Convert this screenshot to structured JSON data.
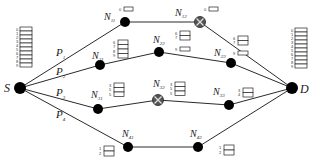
{
  "diagram": {
    "type": "network-path-diagram",
    "nodes": [
      {
        "id": "S",
        "label": "S",
        "sub": "",
        "x": 20,
        "y": 88,
        "failed": false
      },
      {
        "id": "D",
        "label": "D",
        "sub": "",
        "x": 292,
        "y": 88,
        "failed": false
      },
      {
        "id": "N11",
        "label": "N",
        "sub": "11",
        "x": 125,
        "y": 22,
        "failed": false
      },
      {
        "id": "N12",
        "label": "N",
        "sub": "12",
        "x": 200,
        "y": 22,
        "failed": true
      },
      {
        "id": "N21",
        "label": "N",
        "sub": "21",
        "x": 100,
        "y": 65,
        "failed": false
      },
      {
        "id": "N22",
        "label": "N",
        "sub": "22",
        "x": 159,
        "y": 52,
        "failed": false
      },
      {
        "id": "N23",
        "label": "N",
        "sub": "23",
        "x": 231,
        "y": 63,
        "failed": false
      },
      {
        "id": "N31",
        "label": "N",
        "sub": "31",
        "x": 98,
        "y": 109,
        "failed": false
      },
      {
        "id": "N32",
        "label": "N",
        "sub": "32",
        "x": 158,
        "y": 100,
        "failed": true
      },
      {
        "id": "N33",
        "label": "N",
        "sub": "33",
        "x": 229,
        "y": 105,
        "failed": false
      },
      {
        "id": "N41",
        "label": "N",
        "sub": "41",
        "x": 128,
        "y": 147,
        "failed": false
      },
      {
        "id": "N42",
        "label": "N",
        "sub": "42",
        "x": 198,
        "y": 147,
        "failed": false
      }
    ],
    "paths": [
      {
        "label": "P",
        "sub": "1",
        "route": [
          "S",
          "N11",
          "N12",
          "D"
        ]
      },
      {
        "label": "P",
        "sub": "2",
        "route": [
          "S",
          "N21",
          "N22",
          "N23",
          "D"
        ]
      },
      {
        "label": "P",
        "sub": "3",
        "route": [
          "S",
          "N31",
          "N32",
          "N33",
          "D"
        ]
      },
      {
        "label": "P",
        "sub": "4",
        "route": [
          "S",
          "N41",
          "N42",
          "D"
        ]
      }
    ],
    "buffers": [
      {
        "node": "S",
        "slots": [
          "0",
          "1",
          "2",
          "3",
          "4",
          "5",
          "6",
          "7",
          "8",
          "9"
        ]
      },
      {
        "node": "N11",
        "slots": [
          "0"
        ]
      },
      {
        "node": "N12",
        "slots": [
          "0"
        ]
      },
      {
        "node": "N21",
        "slots": [
          "6",
          "7",
          "8",
          "9"
        ]
      },
      {
        "node": "N22-top",
        "slots": [
          "6",
          "7"
        ]
      },
      {
        "node": "N22-bottom",
        "slots": [
          "9"
        ]
      },
      {
        "node": "N23-top",
        "slots": [
          "6",
          "7"
        ]
      },
      {
        "node": "N23-bottom",
        "slots": [
          "9"
        ]
      },
      {
        "node": "N31",
        "slots": [
          "3",
          "5",
          "5"
        ]
      },
      {
        "node": "N32",
        "slots": [
          "3",
          "5",
          "5"
        ]
      },
      {
        "node": "N33",
        "slots": [
          "3",
          "4"
        ]
      },
      {
        "node": "N41",
        "slots": [
          "1",
          "2"
        ]
      },
      {
        "node": "N42",
        "slots": [
          "1",
          "2"
        ]
      },
      {
        "node": "D",
        "slots": [
          "0",
          "1",
          "2",
          "3",
          "4",
          "5",
          "6",
          "7",
          "8",
          "9"
        ]
      }
    ]
  },
  "labels": {
    "S": "S",
    "D": "D",
    "N": "N",
    "N11": "11",
    "N12": "12",
    "N21": "21",
    "N22": "22",
    "N23": "23",
    "N31": "31",
    "N32": "32",
    "N33": "33",
    "N41": "41",
    "N42": "42",
    "P": "P",
    "P1": "1",
    "P2": "2",
    "P3": "3",
    "P4": "4"
  },
  "buffer_labels": {
    "S": [
      "0",
      "1",
      "2",
      "3",
      "4",
      "5",
      "6",
      "7",
      "8",
      "9"
    ],
    "D": [
      "0",
      "1",
      "2",
      "3",
      "4",
      "5",
      "6",
      "7",
      "8",
      "9"
    ],
    "N11": [
      "0"
    ],
    "N12": [
      "0"
    ],
    "N21": [
      "6",
      "7",
      "8",
      "9"
    ],
    "N22a": [
      "6",
      "7"
    ],
    "N22b": [
      "9"
    ],
    "N23a": [
      "6",
      "7"
    ],
    "N23b": [
      "9"
    ],
    "N31": [
      "3",
      "5",
      "5"
    ],
    "N32": [
      "3",
      "5",
      "5"
    ],
    "N33": [
      "3",
      "4"
    ],
    "N41": [
      "1",
      "2"
    ],
    "N42": [
      "1",
      "2"
    ]
  }
}
